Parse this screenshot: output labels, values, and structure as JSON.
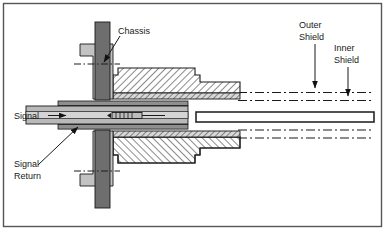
{
  "figure": {
    "kind": "technical-cross-section-diagram",
    "border_color": "#555555",
    "background_color": "#ffffff"
  },
  "labels": {
    "chassis": "Chassis",
    "outer_shield_line1": "Outer",
    "outer_shield_line2": "Shield",
    "inner_shield_line1": "Inner",
    "inner_shield_line2": "Shield",
    "signal": "Signal",
    "signal_return_line1": "Signal",
    "signal_return_line2": "Return"
  },
  "icons": {
    "chassis_leader": "arrow-down-left-icon",
    "outer_shield_leader": "arrow-down-icon",
    "inner_shield_leader": "arrow-down-icon",
    "signal_leader": "arrow-right-icon",
    "signal_return_leader": "arrow-up-right-icon"
  },
  "colors": {
    "outline": "#1a1a1a",
    "chassis_dark": "#6e6e6e",
    "bracket_gray": "#c2c2c2",
    "dielectric_gray": "#b9b9b9",
    "conductor_gray": "#9a9a9a",
    "hatch_fill": "#ffffff",
    "hatch_line": "#2a2a2a"
  },
  "parts": {
    "chassis_panel": "chassis-panel",
    "mounting_bracket": "mounting-bracket",
    "connector_body_upper": "connector-body-upper",
    "connector_body_lower": "connector-body-lower",
    "outer_shield_braid": "outer-shield-braid",
    "inner_shield_braid": "inner-shield-braid",
    "center_conductor": "center-conductor",
    "spring_contact": "spring-contact",
    "cable_jacket": "cable-jacket",
    "centerline_upper": "centerline-upper",
    "centerline_lower": "centerline-lower"
  }
}
